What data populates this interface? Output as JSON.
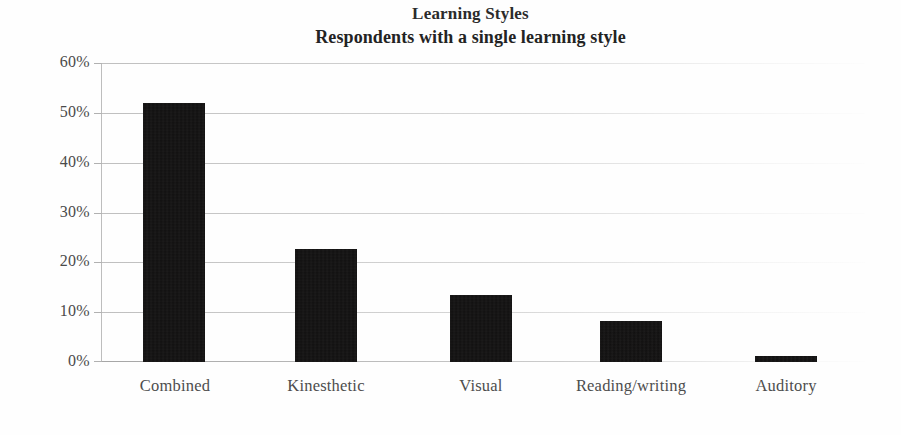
{
  "chart_data": {
    "type": "bar",
    "title": "Learning Styles",
    "subtitle": "Respondents with a single learning style",
    "xlabel": "",
    "ylabel": "",
    "categories": [
      "Combined",
      "Kinesthetic",
      "Visual",
      "Reading/writing",
      "Auditory"
    ],
    "values": [
      52.0,
      22.7,
      13.5,
      8.2,
      1.2
    ],
    "value_labels": [
      "52%",
      "22.7%",
      "13.5%",
      "8.2%",
      "1.2%"
    ],
    "ylim": [
      0,
      60
    ],
    "ytick_labels": [
      "60%",
      "50%",
      "40%",
      "30%",
      "20%",
      "10%",
      "0%"
    ],
    "ytick_values": [
      60,
      50,
      40,
      30,
      20,
      10,
      0
    ],
    "grid": true,
    "legend": "none",
    "bar_color": "#100f0f",
    "gridline_color": "#aaaaaa",
    "axis_color": "#b2b2b2",
    "text_color": "#4a4a4a",
    "title_color": "#232323",
    "background_color": "#fefefe"
  }
}
